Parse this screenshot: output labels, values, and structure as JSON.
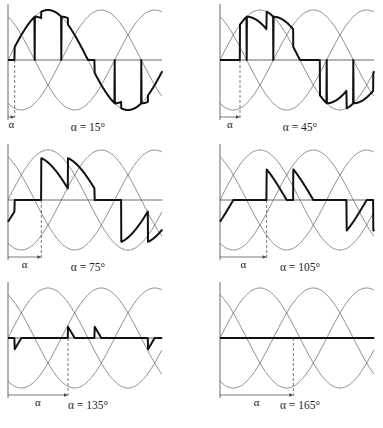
{
  "figure": {
    "symbol": "α",
    "colors": {
      "sine": "#5a5a5a",
      "output": "#111111",
      "axis": "#444444",
      "background": "#ffffff"
    },
    "panels": [
      {
        "alpha": 15,
        "caption": "α = 15°",
        "alpha_label": "α"
      },
      {
        "alpha": 45,
        "caption": "α = 45°",
        "alpha_label": "α"
      },
      {
        "alpha": 75,
        "caption": "α = 75°",
        "alpha_label": "α"
      },
      {
        "alpha": 105,
        "caption": "α = 105°",
        "alpha_label": "α"
      },
      {
        "alpha": 135,
        "caption": "α = 135°",
        "alpha_label": "α"
      },
      {
        "alpha": 165,
        "caption": "α = 165°",
        "alpha_label": "α"
      }
    ]
  },
  "chart_data": {
    "type": "line",
    "title": "",
    "layout": "3 rows × 2 columns of waveform panels",
    "x": "electrical angle ωt (deg), 0–347",
    "series_per_panel": [
      {
        "name": "va",
        "expr": "sin(ωt)"
      },
      {
        "name": "vb",
        "expr": "sin(ωt − 120°)"
      },
      {
        "name": "vc",
        "expr": "sin(ωt + 120°)"
      },
      {
        "name": "output",
        "expr": "controller phase voltage (bold)"
      }
    ],
    "alphas_deg": [
      15,
      45,
      75,
      105,
      135,
      165
    ],
    "captions": [
      "α = 15°",
      "α = 45°",
      "α = 75°",
      "α = 105°",
      "α = 135°",
      "α = 165°"
    ],
    "grid": false,
    "legend": "none"
  }
}
